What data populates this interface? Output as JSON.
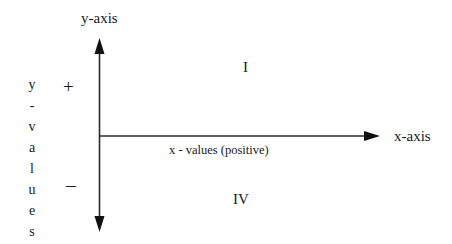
{
  "diagram": {
    "y_axis": {
      "label": "y-axis",
      "bidirectional": true
    },
    "x_axis": {
      "label": "x-axis",
      "direction": "positive only"
    },
    "quadrants": [
      {
        "id": "I",
        "label": "I",
        "position": "upper-right"
      },
      {
        "id": "IV",
        "label": "IV",
        "position": "lower-right"
      }
    ],
    "y_values_label": {
      "text": "y-values",
      "letters": [
        "y",
        "-",
        "v",
        "a",
        "l",
        "u",
        "e",
        "s"
      ]
    },
    "signs": {
      "positive": "+",
      "negative": "–"
    },
    "x_values_label": "x - values (positive)",
    "colors": {
      "line": "#1a1a1a",
      "text": "#1a1a1a",
      "background": "#ffffff"
    }
  }
}
